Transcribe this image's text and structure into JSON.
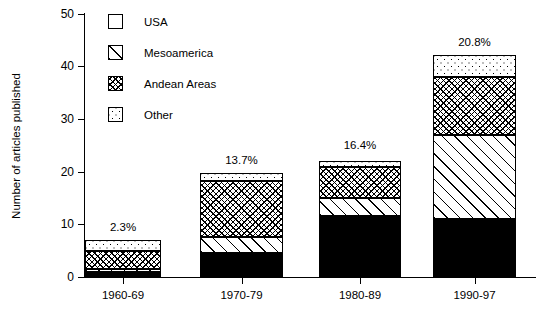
{
  "chart_data": {
    "type": "bar",
    "subtype": "stacked-bar",
    "title": "",
    "xlabel": "",
    "ylabel": "Number of articles published",
    "categories": [
      "1960-69",
      "1970-79",
      "1980-89",
      "1990-97"
    ],
    "ylim": [
      0,
      50
    ],
    "yticks": [
      0,
      10,
      20,
      30,
      40,
      50
    ],
    "ytick_labels": [
      "0",
      "10",
      "20",
      "30",
      "40",
      "50"
    ],
    "grid": false,
    "legend_position": "top-left inside plot",
    "series": [
      {
        "name": "USA",
        "pattern": "solid-black",
        "values": [
          1.0,
          4.5,
          11.5,
          11.0
        ]
      },
      {
        "name": "Mesoamerica",
        "pattern": "diagonal-hatch",
        "values": [
          0.5,
          3.0,
          3.5,
          16.0
        ]
      },
      {
        "name": "Andean Areas",
        "pattern": "cross-hatch",
        "values": [
          3.5,
          10.7,
          5.8,
          11.0
        ]
      },
      {
        "name": "Other",
        "pattern": "dotted",
        "values": [
          2.0,
          1.6,
          1.2,
          4.2
        ]
      }
    ],
    "totals": [
      7.0,
      19.8,
      22.5,
      42.2
    ],
    "annotations": [
      {
        "category": "1960-69",
        "label": "2.3%"
      },
      {
        "category": "1970-79",
        "label": "13.7%"
      },
      {
        "category": "1980-89",
        "label": "16.4%"
      },
      {
        "category": "1990-97",
        "label": "20.8%"
      }
    ],
    "colors": {
      "ink": "#000000",
      "background": "#ffffff"
    }
  },
  "legend": {
    "items": [
      {
        "label": "USA"
      },
      {
        "label": "Mesoamerica"
      },
      {
        "label": "Andean Areas"
      },
      {
        "label": "Other"
      }
    ]
  }
}
